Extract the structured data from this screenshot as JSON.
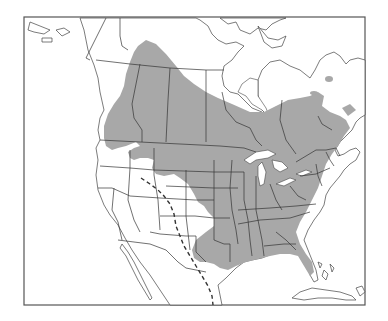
{
  "map": {
    "title": "",
    "region": "North America",
    "type": "species range map",
    "colors": {
      "background": "#ffffff",
      "range_fill": "#a8a8a8",
      "outline": "#444444",
      "dashed_boundary": "#333333"
    },
    "layers": [
      {
        "name": "range",
        "description": "shaded distribution area",
        "fill": "#a8a8a8"
      },
      {
        "name": "political-borders",
        "description": "country, state and province borders"
      },
      {
        "name": "dashed-line",
        "description": "dashed boundary line running from the northern Rockies south through Colorado, New Mexico, west Texas into Mexico"
      }
    ]
  }
}
